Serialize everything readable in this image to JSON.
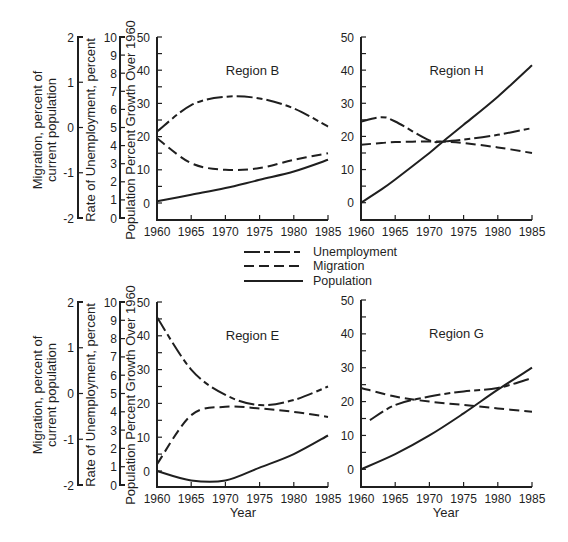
{
  "figure": {
    "left_axes": {
      "migration_label_line1": "Migration, percent of",
      "migration_label_line2": "current population",
      "migration_ticks": [
        "2",
        "1",
        "0",
        "-1",
        "-2"
      ],
      "unemployment_label": "Rate of Unemployment, percent",
      "unemployment_ticks": [
        "10",
        "9",
        "8",
        "7",
        "6",
        "5",
        "4",
        "3",
        "2",
        "1",
        "0"
      ],
      "population_label": "Population Percent Growth Over 1960"
    },
    "xlabel": "Year",
    "legend": [
      {
        "label": "Unemployment",
        "style": "dash-dot"
      },
      {
        "label": "Migration",
        "style": "dashed"
      },
      {
        "label": "Population",
        "style": "solid"
      }
    ],
    "line_color": "#1f1f1f",
    "background": "#ffffff"
  },
  "chart_data": [
    {
      "type": "line",
      "title": "Region B",
      "xlabel": "",
      "ylabel": "Population Percent Growth Over 1960",
      "x": [
        1960,
        1965,
        1970,
        1975,
        1980,
        1985
      ],
      "xticks": [
        "1960",
        "1965",
        "1970",
        "1975",
        "1980",
        "1985"
      ],
      "yticks": [
        "0",
        "10",
        "20",
        "30",
        "40",
        "50"
      ],
      "ylim": [
        -5,
        50
      ],
      "xlim": [
        1960,
        1985
      ],
      "grid": false,
      "legend_position": "between rows, center",
      "secondary_axes": {
        "unemployment_percent": [
          0,
          10
        ],
        "migration_percent": [
          -2,
          2
        ]
      },
      "series": [
        {
          "name": "Unemployment",
          "style": "dash-dot",
          "values": [
            21.5,
            29.5,
            32.0,
            31.5,
            28.5,
            23.0
          ]
        },
        {
          "name": "Migration",
          "style": "dashed",
          "values": [
            19.5,
            12.0,
            10.0,
            10.5,
            13.0,
            15.0
          ]
        },
        {
          "name": "Population",
          "style": "solid",
          "values": [
            0.5,
            2.5,
            4.5,
            7.0,
            9.5,
            13.0
          ]
        }
      ]
    },
    {
      "type": "line",
      "title": "Region H",
      "xlabel": "",
      "ylabel": "",
      "x": [
        1960,
        1963,
        1965,
        1970,
        1972,
        1975,
        1980,
        1985
      ],
      "xticks": [
        "1960",
        "1965",
        "1970",
        "1975",
        "1980",
        "1985"
      ],
      "yticks": [
        "0",
        "10",
        "20",
        "30",
        "40",
        "50"
      ],
      "ylim": [
        -5,
        50
      ],
      "xlim": [
        1960,
        1985
      ],
      "grid": false,
      "series": [
        {
          "name": "Unemployment",
          "style": "dash-dot",
          "values": [
            24.5,
            25.8,
            24.5,
            18.8,
            18.5,
            19.0,
            20.5,
            22.5
          ]
        },
        {
          "name": "Migration",
          "style": "dashed",
          "values": [
            17.5,
            18.0,
            18.3,
            18.5,
            18.4,
            18.0,
            16.7,
            15.0
          ]
        },
        {
          "name": "Population",
          "style": "solid",
          "values": [
            0.0,
            4.0,
            7.0,
            15.0,
            18.5,
            23.5,
            32.0,
            41.5
          ]
        }
      ]
    },
    {
      "type": "line",
      "title": "Region E",
      "xlabel": "Year",
      "ylabel": "Population Percent Growth Over 1960",
      "x": [
        1960,
        1965,
        1970,
        1975,
        1980,
        1985
      ],
      "xticks": [
        "1960",
        "1965",
        "1970",
        "1975",
        "1980",
        "1985"
      ],
      "yticks": [
        "0",
        "10",
        "20",
        "30",
        "40",
        "50"
      ],
      "ylim": [
        -5,
        50
      ],
      "xlim": [
        1960,
        1985
      ],
      "grid": false,
      "secondary_axes": {
        "unemployment_percent": [
          0,
          10
        ],
        "migration_percent": [
          -2,
          2
        ]
      },
      "series": [
        {
          "name": "Unemployment",
          "style": "dash-dot",
          "values": [
            45.5,
            30.0,
            22.5,
            19.5,
            21.0,
            25.0
          ]
        },
        {
          "name": "Migration",
          "style": "dashed",
          "values": [
            2.0,
            16.5,
            19.0,
            18.5,
            17.5,
            16.0
          ]
        },
        {
          "name": "Population",
          "style": "solid",
          "values": [
            0.0,
            -2.8,
            -2.8,
            1.0,
            5.0,
            10.5
          ]
        }
      ]
    },
    {
      "type": "line",
      "title": "Region G",
      "xlabel": "Year",
      "ylabel": "",
      "x": [
        1960,
        1965,
        1970,
        1975,
        1980,
        1985
      ],
      "xticks": [
        "1960",
        "1965",
        "1970",
        "1975",
        "1980",
        "1985"
      ],
      "yticks": [
        "0",
        "10",
        "20",
        "30",
        "40",
        "50"
      ],
      "ylim": [
        -5,
        50
      ],
      "xlim": [
        1960,
        1985
      ],
      "grid": false,
      "series": [
        {
          "name": "Unemployment",
          "style": "dash-dot",
          "values": [
            14.5,
            19.0,
            21.5,
            23.0,
            24.0,
            27.0
          ],
          "note": "curve begins at ~1961"
        },
        {
          "name": "Migration",
          "style": "dashed",
          "values": [
            24.0,
            21.5,
            20.0,
            19.0,
            18.0,
            17.0
          ]
        },
        {
          "name": "Population",
          "style": "solid",
          "values": [
            0.0,
            4.5,
            10.0,
            16.5,
            23.5,
            30.0
          ]
        }
      ]
    }
  ]
}
